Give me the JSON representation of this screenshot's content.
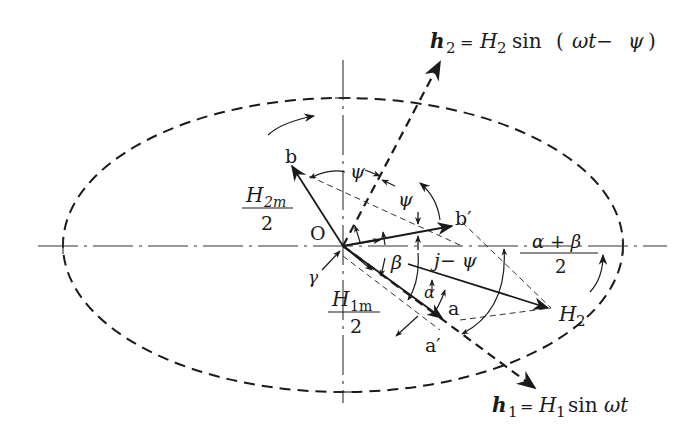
{
  "diagram": {
    "equations": {
      "h2": {
        "lhs": "h",
        "lhs_sub": "2",
        "eq": "=",
        "H": "H",
        "H_sub": "2",
        "rhs": "sin (ωt− ψ)",
        "rhs_sin": "sin",
        "rhs_paren_open": "(",
        "rhs_omega_t": "ωt−",
        "rhs_psi": "ψ",
        "rhs_paren_close": ")"
      },
      "h1": {
        "lhs": "h",
        "lhs_sub": "1",
        "eq": "=",
        "H": "H",
        "H_sub": "1",
        "rhs_sin": "sin",
        "rhs_omega_t": "ωt"
      }
    },
    "labels": {
      "origin": "O",
      "b": "b",
      "b_prime": "b′",
      "a": "a",
      "a_prime": "a′",
      "H2_point": "H",
      "H2_point_sub": "2",
      "H2m_num": "H",
      "H2m_num_sub": "2m",
      "H2m_den": "2",
      "H1m_num": "H",
      "H1m_num_sub": "1m",
      "H1m_den": "2",
      "psi_1": "ψ",
      "psi_2": "ψ",
      "beta": "β",
      "alpha": "α",
      "gamma": "γ",
      "j_minus_psi": "j− ψ",
      "alpha_plus_beta_num": "α + β",
      "alpha_plus_beta_den": "2"
    },
    "elements": [
      "ellipse-locus",
      "horizontal-axis",
      "vertical-axis",
      "h1-direction-line",
      "h2-direction-line",
      "vector-b",
      "vector-a",
      "vector-b-prime",
      "vector-H2",
      "rotation-arrows"
    ]
  }
}
